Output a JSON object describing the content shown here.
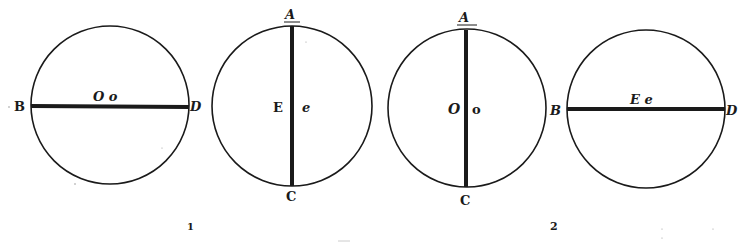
{
  "colors": {
    "ink": "#1a1a1a",
    "paper": "#ffffff"
  },
  "figures": [
    {
      "number": "1",
      "circles": [
        {
          "id": "fig1-left",
          "diameter": "horizontal",
          "labels": {
            "left_end": "B",
            "right_end": "D",
            "center": "O o"
          }
        },
        {
          "id": "fig1-right",
          "diameter": "vertical",
          "labels": {
            "top_end": "A",
            "bottom_end": "C",
            "center_left": "E",
            "center_right": "e"
          }
        }
      ]
    },
    {
      "number": "2",
      "circles": [
        {
          "id": "fig2-left",
          "diameter": "vertical",
          "labels": {
            "top_end": "A",
            "bottom_end": "C",
            "center_left": "O",
            "center_right": "o"
          }
        },
        {
          "id": "fig2-right",
          "diameter": "horizontal",
          "labels": {
            "left_end": "B",
            "right_end": "D",
            "center": "E e"
          }
        }
      ]
    }
  ]
}
